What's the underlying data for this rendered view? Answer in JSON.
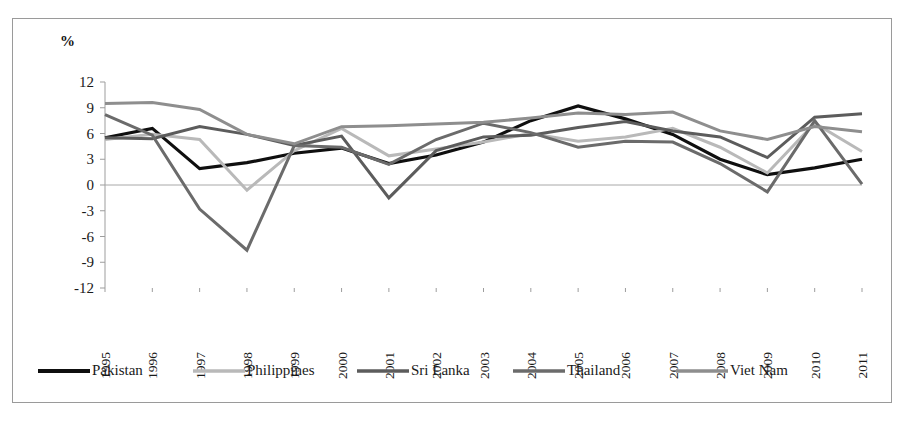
{
  "axis_unit_label": "%",
  "chart_data": {
    "type": "line",
    "title": "",
    "subtitle": "",
    "xlabel": "",
    "ylabel": "%",
    "grid": false,
    "legend_position": "bottom",
    "ylim": [
      -12,
      12
    ],
    "yticks": [
      12,
      9,
      6,
      3,
      0,
      -3,
      -6,
      -9,
      -12
    ],
    "categories": [
      "1995",
      "1996",
      "1997",
      "1998",
      "1999",
      "2000",
      "2001",
      "2002",
      "2003",
      "2004",
      "2005",
      "2006",
      "2007",
      "2008",
      "2009",
      "2010",
      "2011"
    ],
    "x": [
      "1995",
      "1996",
      "1997",
      "1998",
      "1999",
      "2000",
      "2001",
      "2002",
      "2003",
      "2004",
      "2005",
      "2006",
      "2007",
      "2008",
      "2009",
      "2010",
      "2011"
    ],
    "series": [
      {
        "name": "Pakistan",
        "color": "#0f0f0f",
        "values": [
          5.5,
          6.6,
          1.9,
          2.6,
          3.7,
          4.3,
          2.5,
          3.5,
          5.0,
          7.5,
          9.2,
          7.7,
          5.9,
          3.0,
          1.2,
          2.0,
          3.0
        ]
      },
      {
        "name": "Philippines",
        "color": "#b9b9b9",
        "values": [
          5.3,
          5.9,
          5.3,
          -0.6,
          4.0,
          6.6,
          3.4,
          4.2,
          5.0,
          6.0,
          5.1,
          5.6,
          6.6,
          4.4,
          1.4,
          7.2,
          3.9
        ]
      },
      {
        "name": "Sri Lanka",
        "color": "#5c5c5c",
        "values": [
          5.5,
          5.4,
          6.8,
          5.9,
          4.6,
          5.7,
          -1.5,
          4.0,
          5.6,
          5.8,
          6.7,
          7.4,
          6.3,
          5.6,
          3.2,
          7.9,
          8.3
        ]
      },
      {
        "name": "Thailand",
        "color": "#6b6b6b",
        "values": [
          8.2,
          5.8,
          -2.8,
          -7.6,
          4.6,
          4.4,
          2.4,
          5.3,
          7.2,
          6.1,
          4.4,
          5.1,
          5.0,
          2.5,
          -0.8,
          7.5,
          0.1
        ]
      },
      {
        "name": "Viet Nam",
        "color": "#8e8e8e",
        "values": [
          9.5,
          9.6,
          8.8,
          5.9,
          4.8,
          6.8,
          6.9,
          7.1,
          7.3,
          7.8,
          8.4,
          8.2,
          8.5,
          6.3,
          5.3,
          6.8,
          6.2
        ]
      }
    ]
  },
  "legend": {
    "items": [
      {
        "label": "Pakistan"
      },
      {
        "label": "Philippines"
      },
      {
        "label": "Sri Lanka"
      },
      {
        "label": "Thailand"
      },
      {
        "label": "Viet Nam"
      }
    ]
  }
}
